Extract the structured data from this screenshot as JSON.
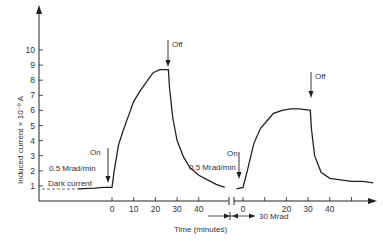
{
  "chart_data": {
    "type": "line",
    "title": "",
    "xlabel": "Time (minutes)",
    "ylabel": "Induced current × 10⁻⁹ A",
    "ylim": [
      0,
      11
    ],
    "yticks": [
      "1",
      "2",
      "3",
      "4",
      "5",
      "6",
      "7",
      "8",
      "9",
      "10"
    ],
    "grid": false,
    "segments": [
      {
        "name": "0.5 Mrad/min exposure 1",
        "xticks": [
          "0",
          "10",
          "20",
          "30",
          "40"
        ],
        "x": [
          -40,
          -20,
          -10,
          0,
          1,
          3,
          5,
          8,
          10,
          13,
          16,
          19,
          22,
          26,
          26.5,
          28,
          30,
          33,
          36,
          40,
          44,
          48,
          52
        ],
        "y": [
          0.8,
          0.85,
          0.9,
          0.9,
          2.0,
          3.7,
          4.6,
          5.8,
          6.6,
          7.3,
          7.9,
          8.5,
          8.7,
          8.7,
          7.5,
          5.5,
          4.0,
          2.9,
          2.2,
          1.7,
          1.4,
          1.1,
          0.9
        ]
      },
      {
        "name": "0.5 Mrad/min exposure 2 (after 30 Mrad)",
        "xticks": [
          "0",
          "20",
          "30",
          "40"
        ],
        "x": [
          -3,
          0,
          2,
          5,
          8,
          11,
          14,
          18,
          22,
          26,
          31,
          31.5,
          33,
          36,
          40,
          45,
          50,
          55,
          60
        ],
        "y": [
          0.8,
          0.9,
          2.0,
          3.8,
          4.8,
          5.3,
          5.8,
          6.0,
          6.1,
          6.1,
          6.0,
          4.8,
          3.0,
          1.9,
          1.5,
          1.4,
          1.3,
          1.3,
          1.2
        ]
      }
    ],
    "annotations": [
      {
        "text": "On",
        "segment": 1,
        "x": 0
      },
      {
        "text": "0.5 Mrad/min",
        "segment": 1
      },
      {
        "text": "Dark current",
        "segment": 1
      },
      {
        "text": "Off",
        "segment": 1,
        "x": 26
      },
      {
        "text": "On",
        "segment": 2,
        "x": 0
      },
      {
        "text": "0.5 Mrad/min",
        "segment": 2
      },
      {
        "text": "Off",
        "segment": 2,
        "x": 31
      },
      {
        "text": "30 Mrad",
        "note": "accumulated dose between exposures"
      }
    ]
  },
  "labels": {
    "ylabel": "Induced current × 10⁻⁹ A",
    "xlabel": "Time (minutes)",
    "on1": "On",
    "rate1": "0.5 Mrad/min",
    "dark": "Dark current",
    "off1": "Off",
    "on2": "On",
    "rate2": "0.5 Mrad/min",
    "off2": "Off",
    "dose": "30 Mrad"
  },
  "colors": {
    "line": "#222222",
    "text": "#333333",
    "background": "#ffffff"
  }
}
